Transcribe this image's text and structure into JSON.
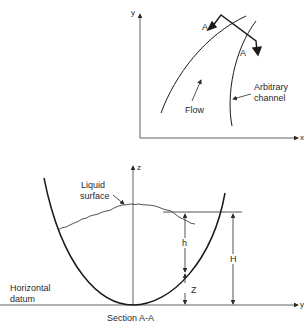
{
  "top_diagram": {
    "axis_y_label": "y",
    "axis_x_label": "x",
    "section_labels": [
      "A",
      "A"
    ],
    "flow_label": "Flow",
    "channel_label_line1": "Arbitrary",
    "channel_label_line2": "channel"
  },
  "bottom_diagram": {
    "axis_z_label": "z",
    "axis_y_label": "y",
    "liquid_surface_line1": "Liquid",
    "liquid_surface_line2": "surface",
    "datum_line1": "Horizontal",
    "datum_line2": "datum",
    "dim_h": "h",
    "dim_H": "H",
    "dim_Z": "Z",
    "caption": "Section A-A"
  },
  "colors": {
    "ink": "#1a1a1a",
    "thin_ink": "#3a3a3a",
    "background": "#ffffff"
  }
}
